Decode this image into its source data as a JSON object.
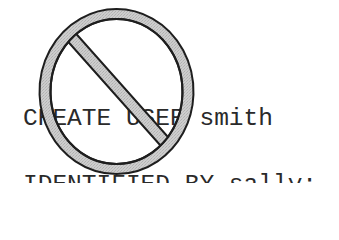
{
  "code": {
    "lines": [
      "CREATE USER smith",
      "IDENTIFIED BY sally;"
    ]
  },
  "overlay": {
    "icon": "prohibited-icon",
    "ring_fill": "#c9c9c9",
    "outline": "#1e1e1e"
  }
}
